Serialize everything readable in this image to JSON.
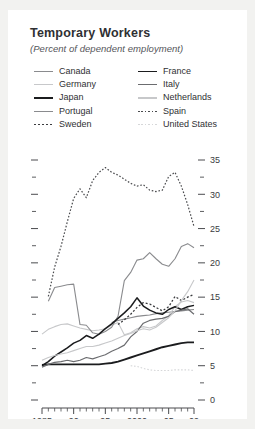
{
  "header": {
    "title": "Temporary Workers",
    "subtitle": "(Percent of dependent employment)"
  },
  "legend": {
    "columns": [
      {
        "items": [
          {
            "label": "Canada",
            "key": "canada"
          },
          {
            "label": "Germany",
            "key": "germany"
          },
          {
            "label": "Japan",
            "key": "japan"
          },
          {
            "label": "Portugal",
            "key": "portugal"
          },
          {
            "label": "Sweden",
            "key": "sweden"
          }
        ]
      },
      {
        "items": [
          {
            "label": "France",
            "key": "france"
          },
          {
            "label": "Italy",
            "key": "italy"
          },
          {
            "label": "Netherlands",
            "key": "netherlands"
          },
          {
            "label": "Spain",
            "key": "spain"
          },
          {
            "label": "United States",
            "key": "united_states"
          }
        ]
      }
    ]
  },
  "axes": {
    "y_ticks": [
      "0",
      "5",
      "10",
      "15",
      "20",
      "25",
      "30",
      "35"
    ],
    "x_ticks": [
      "1985",
      "90",
      "95",
      "2000",
      "05",
      "09"
    ],
    "y_tick_values": [
      0,
      5,
      10,
      15,
      20,
      25,
      30,
      35
    ],
    "x_tick_values": [
      1985,
      1990,
      1995,
      2000,
      2005,
      2009
    ]
  },
  "style": {
    "ink": "#2f3033",
    "mid_gray": "#7c7d80",
    "light_gray": "#bdbec0",
    "pale_gray": "#d6d7d9",
    "axis": "#4a4b4e",
    "card_bg": "#ffffff",
    "page_bg": "#f2f2f0"
  },
  "chart_data": {
    "type": "line",
    "title": "Temporary Workers",
    "subtitle": "(Percent of dependent employment)",
    "xlabel": "",
    "ylabel": "",
    "xlim": [
      1985,
      2009
    ],
    "ylim": [
      0,
      35
    ],
    "grid": false,
    "legend_position": "top",
    "x": [
      1985,
      1986,
      1987,
      1988,
      1989,
      1990,
      1991,
      1992,
      1993,
      1994,
      1995,
      1996,
      1997,
      1998,
      1999,
      2000,
      2001,
      2002,
      2003,
      2004,
      2005,
      2006,
      2007,
      2008,
      2009
    ],
    "series": [
      {
        "name": "Canada",
        "color": "#8a8b8e",
        "width": 1.1,
        "dash": "",
        "values": [
          null,
          null,
          null,
          null,
          null,
          null,
          null,
          null,
          null,
          null,
          null,
          11.3,
          11.6,
          11.8,
          12.0,
          12.2,
          12.3,
          12.4,
          12.6,
          12.7,
          12.8,
          12.9,
          13.0,
          13.1,
          13.2
        ]
      },
      {
        "name": "Germany",
        "color": "#c7c8ca",
        "width": 1.1,
        "dash": "",
        "values": [
          9.6,
          10.3,
          10.7,
          11.0,
          11.1,
          10.8,
          10.5,
          10.3,
          10.1,
          10.2,
          10.4,
          10.9,
          11.3,
          9.5,
          9.8,
          10.4,
          10.7,
          10.5,
          10.8,
          11.6,
          12.3,
          13.6,
          14.3,
          14.5,
          14.2
        ]
      },
      {
        "name": "Japan",
        "color": "#1b1c1e",
        "width": 1.9,
        "dash": "",
        "values": [
          5.1,
          5.2,
          5.2,
          5.2,
          5.2,
          5.2,
          5.2,
          5.2,
          5.2,
          5.2,
          5.3,
          5.4,
          5.6,
          5.9,
          6.2,
          6.5,
          6.8,
          7.1,
          7.4,
          7.7,
          7.9,
          8.1,
          8.3,
          8.4,
          8.4
        ]
      },
      {
        "name": "Portugal",
        "color": "#8a8b8e",
        "width": 1.1,
        "dash": "",
        "values": [
          null,
          14.4,
          16.4,
          16.6,
          16.8,
          16.9,
          11.0,
          10.9,
          9.8,
          9.6,
          10.0,
          10.6,
          12.2,
          17.4,
          18.6,
          20.4,
          20.6,
          21.5,
          20.6,
          19.8,
          19.5,
          20.6,
          22.4,
          22.8,
          22.2
        ]
      },
      {
        "name": "Sweden",
        "color": "#3a3b3e",
        "width": 1.3,
        "dash": "2,2",
        "values": [
          null,
          null,
          null,
          null,
          null,
          null,
          null,
          null,
          null,
          null,
          null,
          null,
          11.0,
          11.7,
          12.5,
          13.5,
          14.2,
          14.0,
          13.5,
          13.0,
          13.6,
          15.1,
          14.5,
          15.0,
          15.4
        ]
      },
      {
        "name": "France",
        "color": "#1b1c1e",
        "width": 1.5,
        "dash": "",
        "values": [
          5.0,
          5.6,
          6.4,
          7.0,
          7.6,
          8.3,
          8.7,
          9.4,
          9.0,
          9.6,
          10.4,
          11.1,
          11.9,
          12.7,
          13.6,
          14.9,
          13.7,
          13.1,
          12.7,
          12.5,
          13.2,
          13.6,
          13.2,
          13.6,
          13.8
        ]
      },
      {
        "name": "Italy",
        "color": "#6b6c6f",
        "width": 1.2,
        "dash": "",
        "values": [
          4.8,
          5.2,
          5.5,
          5.6,
          5.8,
          5.6,
          5.8,
          6.2,
          6.0,
          6.3,
          6.6,
          7.1,
          7.5,
          8.0,
          9.2,
          10.0,
          11.2,
          11.6,
          11.8,
          11.9,
          12.2,
          12.9,
          13.1,
          13.3,
          12.5
        ]
      },
      {
        "name": "Netherlands",
        "color": "#c7c8ca",
        "width": 1.1,
        "dash": "",
        "values": [
          5.8,
          6.2,
          6.5,
          6.7,
          6.9,
          7.2,
          7.5,
          7.8,
          7.8,
          8.0,
          8.3,
          8.6,
          9.0,
          9.4,
          9.7,
          10.1,
          10.4,
          10.2,
          10.6,
          11.3,
          12.0,
          13.0,
          14.5,
          15.8,
          17.5
        ]
      },
      {
        "name": "Spain",
        "color": "#4a4b4e",
        "width": 1.2,
        "dash": "1.6,1.8",
        "values": [
          null,
          15.1,
          19.4,
          22.4,
          26.0,
          29.4,
          30.8,
          29.5,
          32.0,
          33.2,
          33.9,
          33.2,
          32.8,
          32.2,
          31.6,
          31.2,
          31.4,
          30.6,
          30.4,
          30.6,
          32.6,
          33.2,
          31.2,
          28.5,
          25.3
        ]
      },
      {
        "name": "United States",
        "color": "#d6d7d9",
        "width": 1.1,
        "dash": "1.6,1.8",
        "values": [
          null,
          null,
          null,
          null,
          null,
          null,
          null,
          null,
          null,
          null,
          null,
          null,
          null,
          null,
          5.0,
          4.9,
          4.6,
          4.4,
          4.3,
          4.3,
          4.3,
          4.4,
          4.4,
          4.4,
          4.3
        ]
      }
    ]
  }
}
